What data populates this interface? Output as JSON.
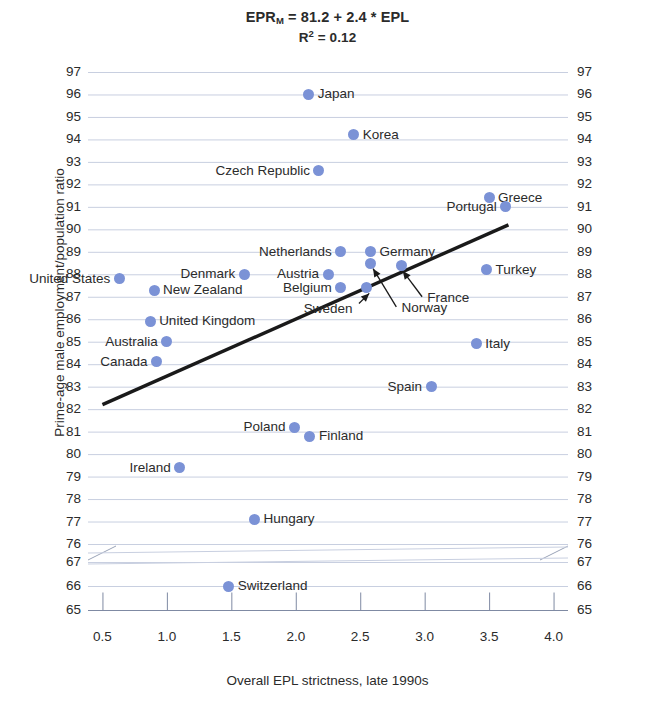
{
  "chart_data": {
    "type": "scatter",
    "title_parts": {
      "main_prefix": "EPR",
      "main_sub": "M",
      "main_rest": " = 81.2 + 2.4 * EPL",
      "r2_prefix": "R",
      "r2_sup": "2",
      "r2_rest": " = 0.12"
    },
    "subtitle": "R2 = 0.12",
    "xlabel": "Overall EPL strictness, late 1990s",
    "ylabel": "Prime-age male employment/population ratio",
    "xlim": [
      0.45,
      4.05
    ],
    "xticks": [
      "0.5",
      "1.0",
      "1.5",
      "2.0",
      "2.5",
      "3.0",
      "3.5",
      "4.0"
    ],
    "xtick_values": [
      0.5,
      1.0,
      1.5,
      2.0,
      2.5,
      3.0,
      3.5,
      4.0
    ],
    "yticks_upper": [
      97,
      96,
      95,
      94,
      93,
      92,
      91,
      90,
      89,
      88,
      87,
      86,
      85,
      84,
      83,
      82,
      81,
      80,
      79,
      78,
      77,
      76
    ],
    "yticks_lower": [
      67,
      66,
      65
    ],
    "axis_break": true,
    "grid": true,
    "legend": "none",
    "point_color": "#7b92d6",
    "line_color": "#1a1a1a",
    "trendline": {
      "x0": 0.5,
      "y0": 82.2,
      "x1": 3.65,
      "y1": 90.2
    },
    "points": [
      {
        "name": "Japan",
        "x": 2.1,
        "y": 96.0,
        "label_side": "right"
      },
      {
        "name": "Korea",
        "x": 2.45,
        "y": 94.2,
        "label_side": "right"
      },
      {
        "name": "Czech Republic",
        "x": 2.18,
        "y": 92.6,
        "label_side": "left"
      },
      {
        "name": "Greece",
        "x": 3.5,
        "y": 91.4,
        "label_side": "right"
      },
      {
        "name": "Portugal",
        "x": 3.63,
        "y": 91.0,
        "label_side": "left"
      },
      {
        "name": "Netherlands",
        "x": 2.35,
        "y": 89.0,
        "label_side": "left"
      },
      {
        "name": "Germany",
        "x": 2.58,
        "y": 89.0,
        "label_side": "right"
      },
      {
        "name": "Norway",
        "x": 2.58,
        "y": 88.5,
        "label_side": "none"
      },
      {
        "name": "France",
        "x": 2.82,
        "y": 88.4,
        "label_side": "none"
      },
      {
        "name": "Denmark",
        "x": 1.6,
        "y": 88.0,
        "label_side": "left"
      },
      {
        "name": "Austria",
        "x": 2.25,
        "y": 88.0,
        "label_side": "left"
      },
      {
        "name": "Turkey",
        "x": 3.48,
        "y": 88.2,
        "label_side": "right"
      },
      {
        "name": "United States",
        "x": 0.63,
        "y": 87.8,
        "label_side": "left"
      },
      {
        "name": "Belgium",
        "x": 2.35,
        "y": 87.4,
        "label_side": "left"
      },
      {
        "name": "Sweden",
        "x": 2.55,
        "y": 87.4,
        "label_side": "none"
      },
      {
        "name": "New Zealand",
        "x": 0.9,
        "y": 87.3,
        "label_side": "right"
      },
      {
        "name": "United Kingdom",
        "x": 0.87,
        "y": 85.9,
        "label_side": "right"
      },
      {
        "name": "Australia",
        "x": 1.0,
        "y": 85.0,
        "label_side": "left"
      },
      {
        "name": "Italy",
        "x": 3.4,
        "y": 84.9,
        "label_side": "right"
      },
      {
        "name": "Canada",
        "x": 0.92,
        "y": 84.1,
        "label_side": "left"
      },
      {
        "name": "Spain",
        "x": 3.05,
        "y": 83.0,
        "label_side": "left"
      },
      {
        "name": "Poland",
        "x": 1.99,
        "y": 81.2,
        "label_side": "left"
      },
      {
        "name": "Finland",
        "x": 2.11,
        "y": 80.8,
        "label_side": "right"
      },
      {
        "name": "Ireland",
        "x": 1.1,
        "y": 79.4,
        "label_side": "left"
      },
      {
        "name": "Hungary",
        "x": 1.68,
        "y": 77.1,
        "label_side": "right"
      },
      {
        "name": "Switzerland",
        "x": 1.48,
        "y": 66.0,
        "label_side": "right"
      }
    ],
    "annotations": [
      {
        "text": "France",
        "points_to": "France"
      },
      {
        "text": "Norway",
        "points_to": "Norway"
      },
      {
        "text": "Sweden",
        "points_to": "Sweden"
      }
    ]
  }
}
